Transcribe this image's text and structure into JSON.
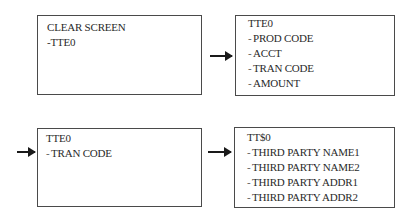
{
  "diagram": {
    "boxes": [
      {
        "id": "box-clear-screen",
        "header": "CLEAR SCREEN",
        "items": [
          {
            "prefix": "-",
            "label": "TTE0"
          }
        ]
      },
      {
        "id": "box-tte0-main",
        "header": "TTE0",
        "items": [
          {
            "prefix": "-",
            "label": "PROD CODE"
          },
          {
            "prefix": "-",
            "label": "ACCT"
          },
          {
            "prefix": "-",
            "label": "TRAN CODE"
          },
          {
            "prefix": "-",
            "label": "AMOUNT"
          }
        ]
      },
      {
        "id": "box-tte0-tran",
        "header": "TTE0",
        "items": [
          {
            "prefix": "-",
            "label": "TRAN CODE"
          }
        ]
      },
      {
        "id": "box-tts0",
        "header": "TT$0",
        "items": [
          {
            "prefix": "-",
            "label": "THIRD PARTY NAME1"
          },
          {
            "prefix": "-",
            "label": "THIRD PARTY NAME2"
          },
          {
            "prefix": "-",
            "label": "THIRD PARTY ADDR1"
          },
          {
            "prefix": "-",
            "label": "THIRD PARTY ADDR2"
          }
        ]
      }
    ],
    "arrows": [
      {
        "from": "box-clear-screen",
        "to": "box-tte0-main"
      },
      {
        "from": "box-tte0-main",
        "to": "box-tte0-tran"
      },
      {
        "from": "box-tte0-tran",
        "to": "box-tts0"
      }
    ]
  }
}
